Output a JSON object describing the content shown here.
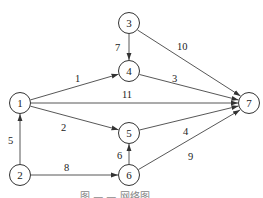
{
  "diagram": {
    "type": "directed-network",
    "nodes": [
      {
        "id": "1",
        "label": "1",
        "x": 20,
        "y": 103
      },
      {
        "id": "2",
        "label": "2",
        "x": 20,
        "y": 175
      },
      {
        "id": "3",
        "label": "3",
        "x": 129,
        "y": 23
      },
      {
        "id": "4",
        "label": "4",
        "x": 129,
        "y": 71
      },
      {
        "id": "5",
        "label": "5",
        "x": 129,
        "y": 133
      },
      {
        "id": "6",
        "label": "6",
        "x": 129,
        "y": 175
      },
      {
        "id": "7",
        "label": "7",
        "x": 249,
        "y": 103
      }
    ],
    "edges": [
      {
        "from": "1",
        "to": "4",
        "label": "1"
      },
      {
        "from": "1",
        "to": "7",
        "label": "11"
      },
      {
        "from": "1",
        "to": "5",
        "label": "2"
      },
      {
        "from": "2",
        "to": "1",
        "label": "5"
      },
      {
        "from": "2",
        "to": "6",
        "label": "8"
      },
      {
        "from": "3",
        "to": "4",
        "label": "7"
      },
      {
        "from": "3",
        "to": "7",
        "label": "10"
      },
      {
        "from": "4",
        "to": "7",
        "label": "3"
      },
      {
        "from": "5",
        "to": "7",
        "label": "4"
      },
      {
        "from": "6",
        "to": "5",
        "label": "6"
      },
      {
        "from": "6",
        "to": "7",
        "label": "9"
      }
    ],
    "caption": "图 — — 网络图"
  }
}
